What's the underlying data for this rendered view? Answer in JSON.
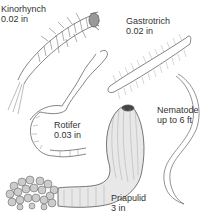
{
  "figure": {
    "colors": {
      "ink": "#555555",
      "light_ink": "#888888",
      "text": "#333333",
      "background": "#ffffff"
    },
    "organisms": [
      {
        "id": "kinorhynch",
        "name": "Kinorhynch",
        "size": "0.02 in"
      },
      {
        "id": "gastrotrich",
        "name": "Gastrotrich",
        "size": "0.02 in"
      },
      {
        "id": "rotifer",
        "name": "Rotifer",
        "size": "0.03 in"
      },
      {
        "id": "nematode",
        "name": "Nematode",
        "size": "up to 6 ft"
      },
      {
        "id": "priapulid",
        "name": "Priapulid",
        "size": "3 in"
      }
    ]
  }
}
